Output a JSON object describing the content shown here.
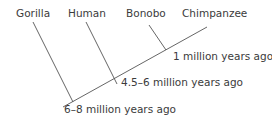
{
  "diagram": {
    "type": "cladogram",
    "line_color": "#555555",
    "species": [
      {
        "name": "Gorilla"
      },
      {
        "name": "Human"
      },
      {
        "name": "Bonobo"
      },
      {
        "name": "Chimpanzee"
      }
    ],
    "divergences": [
      {
        "label": "1 million years ago",
        "between": "Bonobo / Chimpanzee"
      },
      {
        "label": "4.5–6 million years ago",
        "between": "Human / (Bonobo, Chimpanzee)"
      },
      {
        "label": "6–8 million years ago",
        "between": "Gorilla / (Human, Bonobo, Chimpanzee)"
      }
    ]
  }
}
